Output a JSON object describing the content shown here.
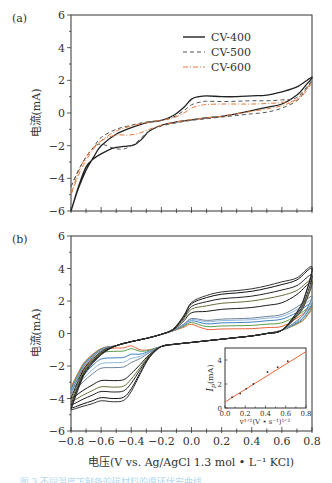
{
  "chart_data": [
    {
      "panel": "(a)",
      "type": "line",
      "title": "",
      "xlabel": "",
      "ylabel": "电流(mA)",
      "xlim": [
        -0.8,
        0.8
      ],
      "ylim": [
        -6,
        6
      ],
      "yticks": [
        6,
        4,
        2,
        0,
        -2,
        -4,
        -6
      ],
      "ytick_labels": [
        "6",
        "4",
        "2",
        "0",
        "−2",
        "−4",
        "−6"
      ],
      "xticks_labeled": false,
      "grid": false,
      "legend_position": "upper center-right",
      "legend": [
        "CV-400",
        "CV-500",
        "CV-600"
      ],
      "series": [
        {
          "name": "CV-400",
          "color": "#222222",
          "style": "solid",
          "x": [
            -0.8,
            -0.75,
            -0.7,
            -0.65,
            -0.6,
            -0.5,
            -0.4,
            -0.3,
            -0.2,
            -0.12,
            -0.05,
            0.0,
            0.05,
            0.1,
            0.2,
            0.3,
            0.4,
            0.5,
            0.6,
            0.7,
            0.8,
            0.75,
            0.7,
            0.6,
            0.5,
            0.4,
            0.3,
            0.2,
            0.1,
            0.0,
            -0.1,
            -0.2,
            -0.28,
            -0.33,
            -0.38,
            -0.45,
            -0.52,
            -0.6,
            -0.65,
            -0.7,
            -0.75,
            -0.8
          ],
          "y": [
            -6.0,
            -4.6,
            -3.5,
            -2.7,
            -2.0,
            -1.3,
            -0.9,
            -0.6,
            -0.45,
            -0.15,
            0.35,
            0.85,
            1.0,
            1.05,
            1.0,
            1.0,
            1.05,
            1.1,
            1.3,
            1.6,
            2.2,
            1.6,
            1.1,
            0.55,
            0.35,
            0.15,
            -0.05,
            -0.2,
            -0.3,
            -0.42,
            -0.55,
            -0.75,
            -1.1,
            -1.6,
            -1.95,
            -2.05,
            -2.15,
            -2.5,
            -2.8,
            -3.3,
            -4.5,
            -6.0
          ]
        },
        {
          "name": "CV-500",
          "color": "#555555",
          "style": "dashed",
          "x": [
            -0.8,
            -0.75,
            -0.7,
            -0.65,
            -0.6,
            -0.5,
            -0.4,
            -0.3,
            -0.2,
            -0.12,
            -0.05,
            0.0,
            0.05,
            0.1,
            0.2,
            0.3,
            0.4,
            0.5,
            0.6,
            0.7,
            0.8,
            0.75,
            0.7,
            0.6,
            0.5,
            0.4,
            0.3,
            0.2,
            0.1,
            0.0,
            -0.1,
            -0.2,
            -0.28,
            -0.33,
            -0.38,
            -0.45,
            -0.52,
            -0.6,
            -0.65,
            -0.7,
            -0.75,
            -0.8
          ],
          "y": [
            -4.5,
            -3.5,
            -2.7,
            -2.1,
            -1.5,
            -1.0,
            -0.75,
            -0.55,
            -0.45,
            -0.25,
            0.15,
            0.5,
            0.65,
            0.72,
            0.7,
            0.72,
            0.75,
            0.75,
            0.8,
            0.95,
            2.0,
            1.3,
            0.75,
            0.3,
            0.05,
            -0.05,
            -0.15,
            -0.25,
            -0.35,
            -0.45,
            -0.6,
            -0.8,
            -1.1,
            -1.5,
            -1.9,
            -2.2,
            -2.15,
            -1.9,
            -2.1,
            -2.7,
            -3.5,
            -4.5
          ]
        },
        {
          "name": "CV-600",
          "color": "#e07a3c",
          "style": "dashdot",
          "x": [
            -0.8,
            -0.75,
            -0.7,
            -0.65,
            -0.6,
            -0.5,
            -0.4,
            -0.3,
            -0.2,
            -0.12,
            -0.05,
            0.0,
            0.05,
            0.1,
            0.2,
            0.3,
            0.4,
            0.5,
            0.6,
            0.7,
            0.8,
            0.75,
            0.7,
            0.6,
            0.5,
            0.4,
            0.3,
            0.2,
            0.1,
            0.0,
            -0.1,
            -0.2,
            -0.28,
            -0.35,
            -0.42,
            -0.5,
            -0.58,
            -0.65,
            -0.7,
            -0.75,
            -0.8
          ],
          "y": [
            -5.0,
            -3.8,
            -2.9,
            -2.2,
            -1.7,
            -1.1,
            -0.8,
            -0.6,
            -0.45,
            -0.3,
            0.0,
            0.3,
            0.45,
            0.52,
            0.55,
            0.55,
            0.55,
            0.58,
            0.65,
            0.85,
            1.9,
            1.2,
            0.8,
            0.45,
            0.25,
            0.1,
            -0.05,
            -0.2,
            -0.3,
            -0.4,
            -0.55,
            -0.75,
            -1.0,
            -1.25,
            -1.35,
            -1.35,
            -1.6,
            -2.1,
            -2.7,
            -3.6,
            -5.0
          ]
        }
      ]
    },
    {
      "panel": "(b)",
      "type": "line",
      "title": "",
      "xlabel": "电压(V vs. Ag/AgCl 1.3 mol • L⁻¹ KCl)",
      "ylabel": "电流(mA)",
      "xlim": [
        -0.8,
        0.8
      ],
      "ylim": [
        -6,
        6
      ],
      "xticks": [
        -0.8,
        -0.6,
        -0.4,
        -0.2,
        0.0,
        0.2,
        0.4,
        0.6,
        0.8
      ],
      "xtick_labels": [
        "−0.8",
        "−0.6",
        "−0.4",
        "−0.2",
        "0.0",
        "0.2",
        "0.4",
        "0.6",
        "0.8"
      ],
      "yticks": [
        6,
        4,
        2,
        0,
        -2,
        -4,
        -6
      ],
      "ytick_labels": [
        "6",
        "4",
        "2",
        "0",
        "−2",
        "−4",
        "−6"
      ],
      "grid": false,
      "series_description": "CV curves at increasing scan rates (anodic plateau current / cathodic peak current at -0.5 V)",
      "series": [
        {
          "name": "scan-1",
          "color": "#e8643a",
          "anodic_plateau": 0.3,
          "cathodic_peak": -0.9,
          "end_high": 1.6,
          "start_low": -3.3
        },
        {
          "name": "scan-2",
          "color": "#5a9a4a",
          "anodic_plateau": 0.5,
          "cathodic_peak": -1.1,
          "end_high": 1.7,
          "start_low": -3.4
        },
        {
          "name": "scan-3",
          "color": "#3d7fc4",
          "anodic_plateau": 0.7,
          "cathodic_peak": -1.5,
          "end_high": 1.9,
          "start_low": -3.5
        },
        {
          "name": "scan-4",
          "color": "#8fb7dc",
          "anodic_plateau": 0.85,
          "cathodic_peak": -1.8,
          "end_high": 2.1,
          "start_low": -3.6
        },
        {
          "name": "scan-5",
          "color": "#6f8296",
          "anodic_plateau": 0.95,
          "cathodic_peak": -2.1,
          "end_high": 2.3,
          "start_low": -3.7
        },
        {
          "name": "scan-6",
          "color": "#1a1a1a",
          "anodic_plateau": 1.6,
          "cathodic_peak": -2.9,
          "end_high": 3.2,
          "start_low": -4.0
        },
        {
          "name": "scan-7",
          "color": "#6b6b3a",
          "anodic_plateau": 2.0,
          "cathodic_peak": -3.3,
          "end_high": 3.3,
          "start_low": -4.2
        },
        {
          "name": "scan-8",
          "color": "#222222",
          "anodic_plateau": 2.3,
          "cathodic_peak": -3.6,
          "end_high": 3.6,
          "start_low": -4.4
        },
        {
          "name": "scan-9",
          "color": "#111111",
          "anodic_plateau": 2.6,
          "cathodic_peak": -4.0,
          "end_high": 4.0,
          "start_low": -4.6
        },
        {
          "name": "scan-10",
          "color": "#333333",
          "anodic_plateau": 2.75,
          "cathodic_peak": -4.2,
          "end_high": 4.1,
          "start_low": -4.7
        }
      ],
      "inset": {
        "type": "scatter",
        "xlabel": "v^{1/2}(V • s^{-1})^{1/2}",
        "ylabel": "I_p(mA)",
        "xlim": [
          0.0,
          0.8
        ],
        "ylim": [
          0,
          5
        ],
        "xticks": [
          0.0,
          0.2,
          0.4,
          0.6,
          0.8
        ],
        "xtick_labels": [
          "0.0",
          "0.2",
          "0.4",
          "0.6",
          "0.8"
        ],
        "yticks": [
          0,
          2,
          4
        ],
        "ytick_labels": [
          "0",
          "2",
          "4"
        ],
        "points": {
          "x": [
            0.07,
            0.15,
            0.21,
            0.28,
            0.42,
            0.52,
            0.62
          ],
          "y": [
            0.9,
            1.2,
            1.6,
            2.0,
            3.0,
            3.4,
            3.9
          ]
        },
        "fit_line": {
          "x": [
            0.0,
            0.8
          ],
          "y": [
            0.5,
            4.7
          ],
          "color": "#e8643a"
        }
      }
    }
  ],
  "labels": {
    "panel_a": "(a)",
    "panel_b": "(b)",
    "ylabel": "电流(mA)",
    "xlabel": "电压(V vs. Ag/AgCl 1.3 mol • L⁻¹ KCl)",
    "inset_ylabel_main": "I",
    "inset_ylabel_sub": "p",
    "inset_ylabel_rest": "(mA)",
    "inset_xlabel": "v¹ᐟ²(V • s⁻¹)¹ᐟ²",
    "caption": "图 3  不同温度下制备的碳材料的循环伏安曲线"
  }
}
